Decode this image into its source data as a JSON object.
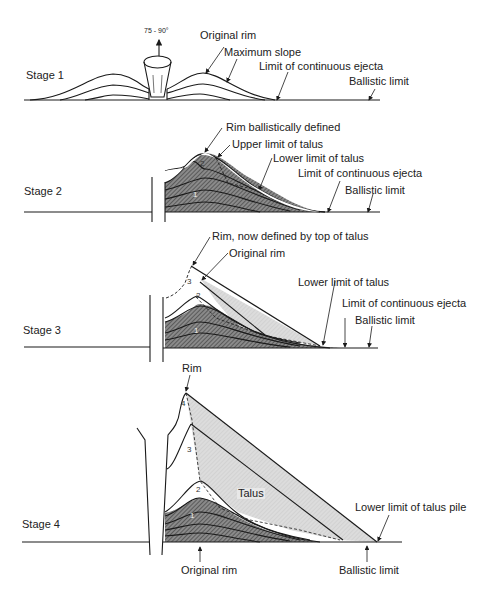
{
  "figure": {
    "type": "cross-section diagram"
  },
  "stages": [
    {
      "label": "Stage 1",
      "annotations": [
        "75 - 90°",
        "Original rim",
        "Maximum slope",
        "Limit of continuous ejecta",
        "Ballistic limit"
      ]
    },
    {
      "label": "Stage 2",
      "annotations": [
        "Rim ballistically defined",
        "Upper limit of talus",
        "Lower limit of talus",
        "Limit of continuous ejecta",
        "Ballistic limit"
      ],
      "layer_numbers": [
        "2",
        "1"
      ]
    },
    {
      "label": "Stage 3",
      "annotations": [
        "Rim, now defined by top of talus",
        "Original rim",
        "Lower limit of talus",
        "Limit of continuous ejecta",
        "Ballistic limit"
      ],
      "layer_numbers": [
        "3",
        "2",
        "1"
      ]
    },
    {
      "label": "Stage 4",
      "annotations": [
        "Rim",
        "Talus",
        "Lower limit of talus pile",
        "Original rim",
        "Ballistic limit"
      ],
      "layer_numbers": [
        "4",
        "3",
        "2",
        "1"
      ]
    }
  ],
  "colors": {
    "line": "#1a1a1a",
    "talus_fill": "#d9d9d9",
    "ejecta_fill": "#7a7a7a",
    "background": "#ffffff"
  }
}
